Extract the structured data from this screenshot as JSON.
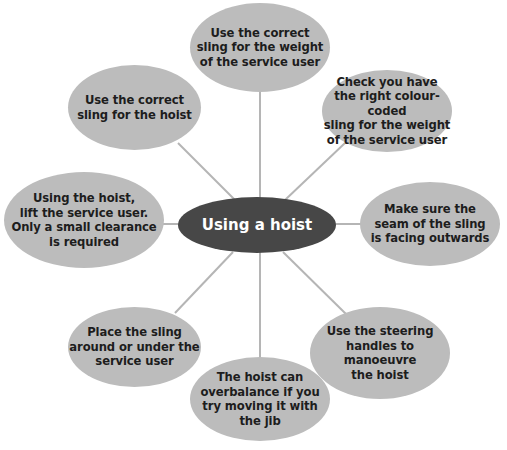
{
  "diagram": {
    "type": "spider-diagram",
    "colors": {
      "center_fill": "#474747",
      "node_fill": "#bcbcbc",
      "link": "#b5b5b5",
      "center_text": "#ffffff",
      "node_text": "#1d1d1d"
    },
    "center": {
      "label": "Using a hoist"
    },
    "nodes": [
      {
        "id": "top",
        "label": "Use the correct sling for the weight of the service user"
      },
      {
        "id": "upper-right",
        "label": "Check you have the right colour-coded sling for the weight of the service user"
      },
      {
        "id": "right",
        "label": "Make sure the seam of the sling is facing outwards"
      },
      {
        "id": "lower-right",
        "label": "Use the steering handles to manoeuvre the hoist"
      },
      {
        "id": "bottom",
        "label": "The hoist can overbalance if you try moving it with the jib"
      },
      {
        "id": "lower-left",
        "label": "Place the sling around or under the service user"
      },
      {
        "id": "left",
        "label": "Using the hoist, lift the service user. Only a small clearance is required"
      },
      {
        "id": "upper-left",
        "label": "Use the correct sling for the hoist"
      }
    ],
    "lines": {
      "top": [
        "Use the correct",
        "sling for the weight",
        "of the service user"
      ],
      "upper-right": [
        "Check you have",
        "the right colour-coded",
        "sling for the weight",
        "of the service user"
      ],
      "right": [
        "Make sure the",
        "seam of the sling",
        "is facing outwards"
      ],
      "lower-right": [
        "Use the steering",
        "handles to manoeuvre",
        "the hoist"
      ],
      "bottom": [
        "The hoist can",
        "overbalance if you",
        "try moving it with",
        "the jib"
      ],
      "lower-left": [
        "Place the sling",
        "around or under the",
        "service user"
      ],
      "left": [
        "Using the hoist,",
        "lift the service user.",
        "Only a small clearance",
        "is required"
      ],
      "upper-left": [
        "Use the correct",
        "sling for the hoist"
      ]
    }
  }
}
